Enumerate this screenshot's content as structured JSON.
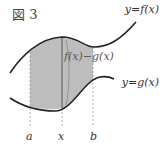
{
  "figure": {
    "title": "図 3",
    "curve_upper_label": "y=f(x)",
    "curve_lower_label": "y=g(x)",
    "difference_label": "f(x)−g(x)",
    "axis_ticks": [
      "a",
      "x",
      "b"
    ],
    "colors": {
      "curve": "#222222",
      "shade": "#bdbdbd",
      "bar": "#8a8a8a",
      "dashed": "#999999",
      "text": "#333333"
    }
  }
}
